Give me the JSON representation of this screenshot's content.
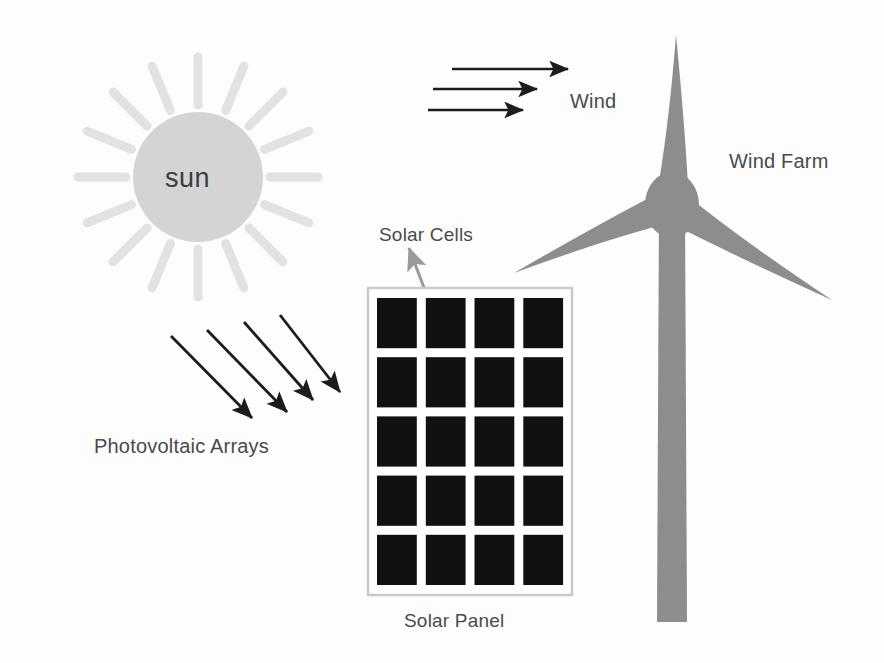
{
  "diagram": {
    "background_color": "#fdfdfd",
    "width": 884,
    "height": 663
  },
  "labels": {
    "sun": "sun",
    "wind": "Wind",
    "wind_farm": "Wind Farm",
    "solar_cells": "Solar Cells",
    "photovoltaic_arrays": "Photovoltaic Arrays",
    "solar_panel": "Solar Panel"
  },
  "colors": {
    "sun_body": "#d4d4d4",
    "sun_rays": "#e2e2e2",
    "turbine": "#8d8d8d",
    "solar_cell": "#111111",
    "panel_frame": "#c9c9c9",
    "arrow_black": "#1c1c1c",
    "arrow_gray": "#9a9a9a",
    "text": "#4a4a4a",
    "background": "#fdfdfd"
  },
  "sun": {
    "center_x": 198,
    "center_y": 177,
    "radius": 65,
    "ray_count": 16,
    "ray_inner_radius": 72,
    "ray_outer_radius": 120
  },
  "wind_arrows": [
    {
      "x1": 452,
      "y1": 69,
      "x2": 568,
      "y2": 69
    },
    {
      "x1": 433,
      "y1": 89,
      "x2": 537,
      "y2": 89
    },
    {
      "x1": 428,
      "y1": 110,
      "x2": 523,
      "y2": 110
    }
  ],
  "sunlight_arrows": [
    {
      "x1": 171,
      "y1": 336,
      "x2": 252,
      "y2": 418
    },
    {
      "x1": 207,
      "y1": 330,
      "x2": 287,
      "y2": 412
    },
    {
      "x1": 244,
      "y1": 322,
      "x2": 313,
      "y2": 400
    },
    {
      "x1": 280,
      "y1": 315,
      "x2": 340,
      "y2": 392
    }
  ],
  "solar_cells_pointer": {
    "from_x": 437,
    "from_y": 322,
    "to_x": 409,
    "to_y": 248
  },
  "solar_panel": {
    "frame_x": 368,
    "frame_y": 288,
    "frame_width": 204,
    "frame_height": 307,
    "columns": 4,
    "rows": 5,
    "cell_count": 20
  },
  "wind_turbine": {
    "hub_center_x": 672,
    "hub_center_y": 205,
    "hub_rx": 27,
    "hub_ry": 33,
    "blade_count": 3,
    "tower_top_y": 205,
    "tower_bottom_y": 622,
    "tower_top_width": 26,
    "tower_bottom_width": 30,
    "blade_tips": [
      {
        "name": "upper-blade",
        "x": 676,
        "y": 35
      },
      {
        "name": "left-blade",
        "x": 514,
        "y": 273
      },
      {
        "name": "right-blade",
        "x": 832,
        "y": 300
      }
    ]
  }
}
